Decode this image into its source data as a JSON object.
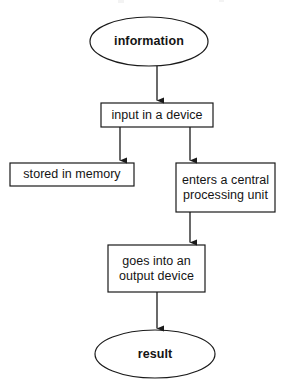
{
  "diagram": {
    "type": "flowchart",
    "orientation": "top-to-bottom",
    "background_color": "#ffffff",
    "stroke_color": "#1a1a1a",
    "text_color": "#141414",
    "nodes": [
      {
        "id": "information",
        "label": "information",
        "shape": "ellipse",
        "role": "terminator",
        "bold": true,
        "x": 90,
        "y": 17,
        "width": 118,
        "height": 49
      },
      {
        "id": "input",
        "label": "input in a device",
        "shape": "rectangle",
        "role": "process",
        "bold": false,
        "x": 101,
        "y": 103,
        "width": 112,
        "height": 24
      },
      {
        "id": "memory",
        "label": "stored in memory",
        "shape": "rectangle",
        "role": "process",
        "bold": false,
        "x": 10,
        "y": 163,
        "width": 124,
        "height": 23
      },
      {
        "id": "cpu",
        "label": "enters a central\nprocessing unit",
        "shape": "rectangle",
        "role": "process",
        "bold": false,
        "x": 176,
        "y": 163,
        "width": 99,
        "height": 49
      },
      {
        "id": "output",
        "label": "goes into an\noutput device",
        "shape": "rectangle",
        "role": "process",
        "bold": false,
        "x": 108,
        "y": 245,
        "width": 97,
        "height": 47
      },
      {
        "id": "result",
        "label": "result",
        "shape": "ellipse",
        "role": "terminator",
        "bold": true,
        "x": 95,
        "y": 330,
        "width": 120,
        "height": 48
      }
    ],
    "connectors": [
      {
        "id": "information-to-input",
        "from": "information",
        "to": "input",
        "style": "straight-arrow",
        "x1": 157,
        "y1": 66,
        "x2": 157,
        "y2": 101
      },
      {
        "id": "input-to-memory",
        "from": "input",
        "to": "memory",
        "style": "elbow-arrow",
        "x1": 120,
        "y1": 127,
        "x2": 120,
        "y2": 161
      },
      {
        "id": "input-to-cpu",
        "from": "input",
        "to": "cpu",
        "style": "elbow-arrow",
        "x1": 190,
        "y1": 127,
        "x2": 190,
        "y2": 161
      },
      {
        "id": "cpu-to-output",
        "from": "cpu",
        "to": "output",
        "style": "straight-arrow",
        "x1": 190,
        "y1": 212,
        "x2": 190,
        "y2": 243
      },
      {
        "id": "output-to-result",
        "from": "output",
        "to": "result",
        "style": "straight-arrow",
        "x1": 157,
        "y1": 292,
        "x2": 157,
        "y2": 329
      }
    ]
  }
}
